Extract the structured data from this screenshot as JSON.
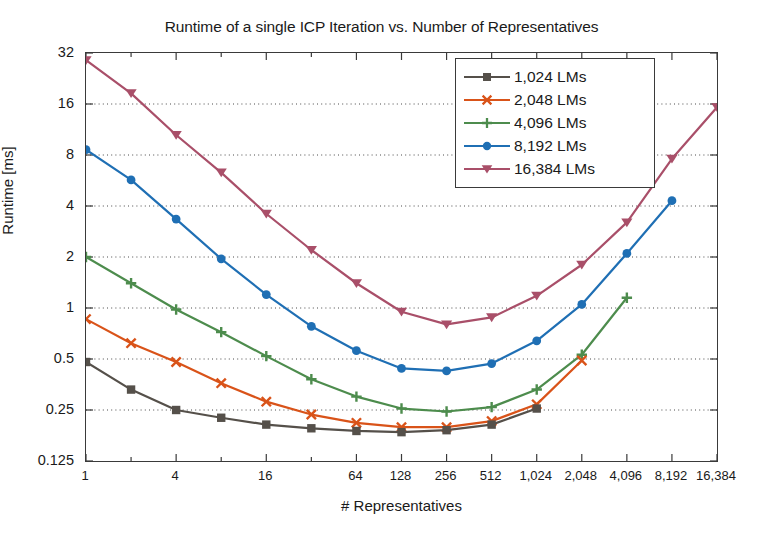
{
  "chart_data": {
    "type": "line",
    "title": "Runtime of a single ICP Iteration vs. Number of Representatives",
    "xlabel": "# Representatives",
    "ylabel": "Runtime [ms]",
    "xscale": "log2",
    "yscale": "log2",
    "xlim": [
      1,
      16384
    ],
    "ylim": [
      0.125,
      32
    ],
    "grid": "horizontal-dotted",
    "legend_position": "top-right-inside",
    "xtick_labels": [
      "1",
      "4",
      "16",
      "64",
      "128",
      "256",
      "512",
      "1,024",
      "2,048",
      "4,096",
      "8,192",
      "16,384"
    ],
    "xtick_values": [
      1,
      4,
      16,
      64,
      128,
      256,
      512,
      1024,
      2048,
      4096,
      8192,
      16384
    ],
    "xtick_minor_values": [
      2,
      8,
      32
    ],
    "ytick_labels": [
      "0.125",
      "0.25",
      "0.5",
      "1",
      "2",
      "4",
      "8",
      "16",
      "32"
    ],
    "ytick_values": [
      0.125,
      0.25,
      0.5,
      1,
      2,
      4,
      8,
      16,
      32
    ],
    "series": [
      {
        "name": "1,024 LMs",
        "color": "#55504a",
        "marker": "square",
        "x": [
          1,
          2,
          4,
          8,
          16,
          32,
          64,
          128,
          256,
          512,
          1024
        ],
        "y": [
          0.48,
          0.33,
          0.25,
          0.225,
          0.205,
          0.195,
          0.188,
          0.185,
          0.19,
          0.205,
          0.255
        ]
      },
      {
        "name": "2,048 LMs",
        "color": "#d95319",
        "marker": "x",
        "x": [
          1,
          2,
          4,
          8,
          16,
          32,
          64,
          128,
          256,
          512,
          1024,
          2048
        ],
        "y": [
          0.86,
          0.62,
          0.48,
          0.36,
          0.28,
          0.235,
          0.21,
          0.198,
          0.198,
          0.215,
          0.27,
          0.49
        ]
      },
      {
        "name": "4,096 LMs",
        "color": "#4d8c4d",
        "marker": "plus",
        "x": [
          1,
          2,
          4,
          8,
          16,
          32,
          64,
          128,
          256,
          512,
          1024,
          2048,
          4096
        ],
        "y": [
          2.0,
          1.4,
          0.98,
          0.72,
          0.52,
          0.38,
          0.3,
          0.255,
          0.245,
          0.26,
          0.33,
          0.53,
          1.15
        ]
      },
      {
        "name": "8,192 LMs",
        "color": "#1f6fb4",
        "marker": "circle",
        "x": [
          1,
          2,
          4,
          8,
          16,
          32,
          64,
          128,
          256,
          512,
          1024,
          2048,
          4096,
          8192
        ],
        "y": [
          8.6,
          5.7,
          3.35,
          1.95,
          1.2,
          0.78,
          0.56,
          0.44,
          0.425,
          0.47,
          0.64,
          1.05,
          2.1,
          4.3
        ]
      },
      {
        "name": "16,384 LMs",
        "color": "#a94f69",
        "marker": "triangle-down",
        "x": [
          1,
          2,
          4,
          8,
          16,
          32,
          64,
          128,
          256,
          512,
          1024,
          2048,
          4096,
          8192,
          16384
        ],
        "y": [
          29.0,
          18.5,
          10.5,
          6.3,
          3.6,
          2.2,
          1.4,
          0.95,
          0.8,
          0.88,
          1.18,
          1.8,
          3.2,
          7.6,
          15.3
        ]
      }
    ]
  }
}
